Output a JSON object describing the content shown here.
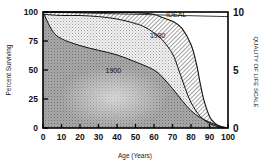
{
  "chart_data": {
    "type": "area",
    "title": "",
    "xlabel": "Age (Years)",
    "ylabel": "Percent Surviving",
    "y2label": "QUALITY OF LIFE SCALE",
    "xlim": [
      0,
      100
    ],
    "ylim": [
      0,
      100
    ],
    "y2lim": [
      0,
      10
    ],
    "grid": false,
    "legend": "inline labels",
    "x_ticks": [
      "0",
      "10",
      "20",
      "30",
      "40",
      "50",
      "60",
      "70",
      "80",
      "90",
      "100"
    ],
    "y_ticks": [
      "0",
      "25",
      "50",
      "75",
      "100"
    ],
    "y2_ticks": [
      "0",
      "5",
      "10"
    ],
    "series": [
      {
        "name": "1900",
        "x": [
          0,
          5,
          10,
          20,
          30,
          40,
          50,
          60,
          65,
          70,
          75,
          80,
          85,
          90,
          95,
          100
        ],
        "values": [
          100,
          84,
          77,
          71,
          67,
          63,
          57,
          50,
          43,
          34,
          24,
          15,
          9,
          5,
          2,
          0
        ],
        "fill": "dark stipple"
      },
      {
        "name": "1980",
        "x": [
          0,
          10,
          20,
          30,
          40,
          50,
          55,
          60,
          65,
          70,
          73,
          76,
          80,
          85,
          90,
          95,
          98
        ],
        "values": [
          98,
          97,
          97,
          96,
          94,
          90,
          87,
          82,
          75,
          64,
          52,
          38,
          22,
          10,
          4,
          1,
          0
        ],
        "fill": "light stipple"
      },
      {
        "name": "IDEAL",
        "x": [
          0,
          20,
          40,
          55,
          60,
          65,
          70,
          75,
          80,
          83,
          85,
          87,
          90,
          93,
          97
        ],
        "values": [
          100,
          100,
          100,
          99,
          98,
          95,
          92,
          86,
          72,
          55,
          38,
          24,
          10,
          4,
          0
        ],
        "fill": "diagonal hatch"
      },
      {
        "name": "Quality of life",
        "axis": "y2",
        "x": [
          0,
          50,
          100
        ],
        "values": [
          10,
          9.8,
          9.6
        ],
        "fill": "none"
      }
    ],
    "annotations": [
      {
        "text": "IDEAL",
        "x": 72,
        "y": 96
      },
      {
        "text": "1980",
        "x": 62,
        "y": 78
      },
      {
        "text": "1900",
        "x": 38,
        "y": 47
      }
    ]
  }
}
